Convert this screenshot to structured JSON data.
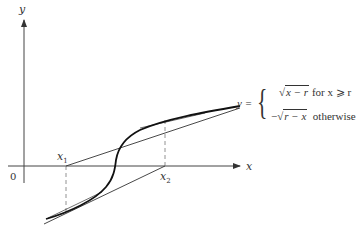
{
  "axes": {
    "x_label": "x",
    "y_label": "y",
    "origin_label": "0"
  },
  "points": {
    "x1_label": "x",
    "x1_sub": "1",
    "x2_label": "x",
    "x2_sub": "2"
  },
  "equation": {
    "lhs": "y =",
    "case1_expr": "x − r",
    "case1_cond": "for x ⩾ r",
    "case2_sign": "−",
    "case2_expr": "r − x",
    "case2_cond": "otherwise",
    "sqrt_symbol": "√",
    "brace": "{"
  },
  "colors": {
    "ink": "#333333",
    "curve": "#111111",
    "dash": "#777777"
  }
}
